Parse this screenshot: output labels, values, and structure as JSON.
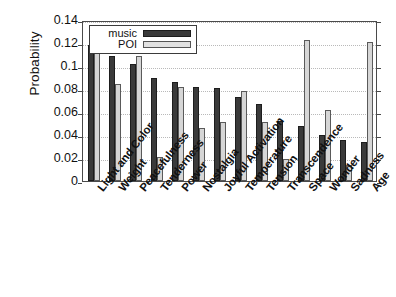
{
  "chart_data": {
    "type": "bar",
    "title": "",
    "xlabel": "",
    "ylabel": "Probability",
    "ylim": [
      0,
      0.14
    ],
    "yticks": [
      "0",
      "0.02",
      "0.04",
      "0.06",
      "0.08",
      "0.1",
      "0.12",
      "0.14"
    ],
    "ytick_values": [
      0,
      0.02,
      0.04,
      0.06,
      0.08,
      0.1,
      0.12,
      0.14
    ],
    "grid": true,
    "legend_position": "upper-left",
    "categories": [
      "Light and Color",
      "Weight",
      "Peacefulness",
      "Tenderness",
      "Power",
      "Nostalgia",
      "Joyful Activation",
      "Temperature",
      "Tension",
      "Transcendence",
      "Space",
      "Wonder",
      "Sadness",
      "Age"
    ],
    "series": [
      {
        "name": "music",
        "color": "#3a3a3a",
        "values": [
          0.118,
          0.109,
          0.102,
          0.09,
          0.086,
          0.082,
          0.081,
          0.073,
          0.067,
          0.052,
          0.048,
          0.04,
          0.036,
          0.034
        ]
      },
      {
        "name": "POI",
        "color": "#d6d6d6",
        "values": [
          0.12,
          0.084,
          0.109,
          0.021,
          0.082,
          0.046,
          0.051,
          0.078,
          0.051,
          0.019,
          0.123,
          0.062,
          0.014,
          0.121
        ]
      }
    ]
  },
  "legend": {
    "items": [
      {
        "label": "music"
      },
      {
        "label": "POI"
      }
    ]
  },
  "axis": {
    "y_title": "Probability"
  }
}
